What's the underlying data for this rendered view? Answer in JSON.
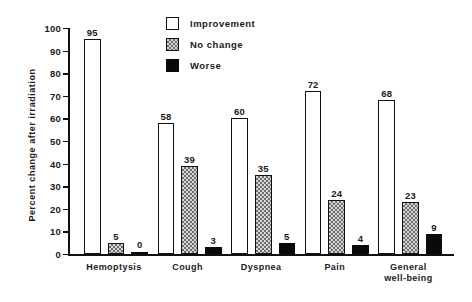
{
  "chart_data": {
    "type": "bar",
    "title": "",
    "subtitle": "",
    "xlabel": "",
    "ylabel": "Percent change after irradiation",
    "ylim": [
      0,
      100
    ],
    "yticks": [
      0,
      10,
      20,
      30,
      40,
      50,
      60,
      70,
      80,
      90,
      100
    ],
    "grid": false,
    "legend_position": "top-center",
    "categories": [
      "Hemoptysis",
      "Cough",
      "Dyspnea",
      "Pain",
      "General\nwell-being"
    ],
    "series": [
      {
        "name": "Improvement",
        "values": [
          95,
          58,
          60,
          72,
          68
        ],
        "color": "#ffffff"
      },
      {
        "name": "No change",
        "values": [
          5,
          39,
          35,
          24,
          23
        ],
        "color": "#d6d6d6"
      },
      {
        "name": "Worse",
        "values": [
          0,
          3,
          5,
          4,
          9
        ],
        "color": "#0a0a0a"
      }
    ]
  },
  "axis": {
    "y_title": "Percent change after irradiation",
    "tick_labels": [
      "100",
      "90",
      "80",
      "70",
      "60",
      "50",
      "40",
      "30",
      "20",
      "10",
      "0"
    ]
  },
  "legend": {
    "items": [
      {
        "label": "Improvement",
        "swatch": "open-square-icon"
      },
      {
        "label": "No  change",
        "swatch": "stippled-square-icon"
      },
      {
        "label": "Worse",
        "swatch": "filled-square-icon"
      }
    ]
  },
  "groups": [
    {
      "label": "Hemoptysis",
      "label_line1": "Hemoptysis",
      "label_line2": "",
      "bars": [
        {
          "series": "Improvement",
          "value": 95,
          "value_text": "95"
        },
        {
          "series": "No change",
          "value": 5,
          "value_text": "5"
        },
        {
          "series": "Worse",
          "value": 0,
          "value_text": "0"
        }
      ]
    },
    {
      "label": "Cough",
      "label_line1": "Cough",
      "label_line2": "",
      "bars": [
        {
          "series": "Improvement",
          "value": 58,
          "value_text": "58"
        },
        {
          "series": "No change",
          "value": 39,
          "value_text": "39"
        },
        {
          "series": "Worse",
          "value": 3,
          "value_text": "3"
        }
      ]
    },
    {
      "label": "Dyspnea",
      "label_line1": "Dyspnea",
      "label_line2": "",
      "bars": [
        {
          "series": "Improvement",
          "value": 60,
          "value_text": "60"
        },
        {
          "series": "No change",
          "value": 35,
          "value_text": "35"
        },
        {
          "series": "Worse",
          "value": 5,
          "value_text": "5"
        }
      ]
    },
    {
      "label": "Pain",
      "label_line1": "Pain",
      "label_line2": "",
      "bars": [
        {
          "series": "Improvement",
          "value": 72,
          "value_text": "72"
        },
        {
          "series": "No change",
          "value": 24,
          "value_text": "24"
        },
        {
          "series": "Worse",
          "value": 4,
          "value_text": "4"
        }
      ]
    },
    {
      "label": "General well-being",
      "label_line1": "General",
      "label_line2": "well-being",
      "bars": [
        {
          "series": "Improvement",
          "value": 68,
          "value_text": "68"
        },
        {
          "series": "No change",
          "value": 23,
          "value_text": "23"
        },
        {
          "series": "Worse",
          "value": 9,
          "value_text": "9"
        }
      ]
    }
  ]
}
